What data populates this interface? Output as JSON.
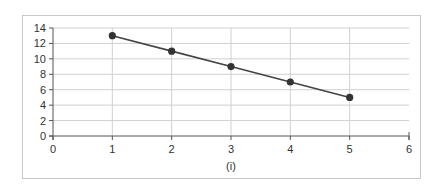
{
  "chart_data": {
    "type": "line",
    "title": "",
    "xlabel": "(i)",
    "ylabel": "",
    "x": [
      1,
      2,
      3,
      4,
      5
    ],
    "series": [
      {
        "name": "series-1",
        "values": [
          13,
          11,
          9,
          7,
          5
        ],
        "color": "#444444"
      }
    ],
    "xlim": [
      0,
      6
    ],
    "ylim": [
      0,
      14
    ],
    "xticks": [
      0,
      1,
      2,
      3,
      4,
      5,
      6
    ],
    "yticks": [
      0,
      2,
      4,
      6,
      8,
      10,
      12,
      14
    ],
    "grid": {
      "horizontal": true,
      "vertical": true
    },
    "legend": null
  },
  "colors": {
    "line": "#444444",
    "marker": "#333333",
    "grid": "#d0d0d0",
    "axis": "#555555",
    "frame": "#c8c8c8"
  }
}
